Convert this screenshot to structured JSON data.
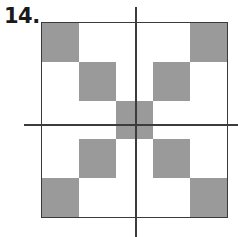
{
  "figure": {
    "label": "14.",
    "colors": {
      "shaded_cell": "#9a9a9a",
      "blank_cell": "#ffffff",
      "square_border": "#3a3a3a",
      "axis_line": "#3c3c3c",
      "label_text": "#1a1a1a",
      "background": "#ffffff"
    },
    "grid": {
      "rows": 5,
      "columns": 5,
      "cell_size_px": 37,
      "shaded_pattern": [
        [
          1,
          0,
          0,
          0,
          1
        ],
        [
          0,
          1,
          0,
          1,
          0
        ],
        [
          0,
          0,
          1,
          0,
          0
        ],
        [
          0,
          1,
          0,
          1,
          0
        ],
        [
          1,
          0,
          0,
          0,
          1
        ]
      ],
      "shaded_count": 9
    },
    "axes": {
      "vertical": {
        "name": "vertical-axis",
        "position": "center column",
        "extends_beyond_square": true
      },
      "horizontal": {
        "name": "horizontal-axis",
        "position": "center row",
        "extends_beyond_square": true
      }
    }
  }
}
